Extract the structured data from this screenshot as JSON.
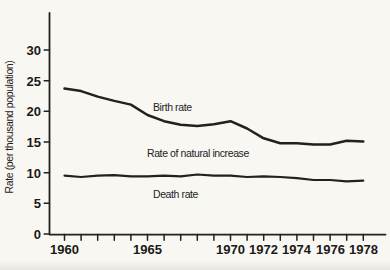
{
  "figure": {
    "background": "#f9f7f2",
    "ink": "#222120"
  },
  "chart_data": {
    "type": "line",
    "title": "",
    "xlabel": "",
    "ylabel": "Rate (per thousand population)",
    "ylim": [
      0,
      33
    ],
    "xlim": [
      1959,
      1979.3
    ],
    "grid": false,
    "legend_position": "none",
    "yticks": [
      0,
      5,
      10,
      15,
      20,
      25,
      30
    ],
    "xticks_labeled": [
      "1960",
      "1965",
      "1970",
      "1972",
      "1974",
      "1976",
      "1978"
    ],
    "xtick_minor_interval_years": 1,
    "x": [
      1960,
      1961,
      1962,
      1963,
      1964,
      1965,
      1966,
      1967,
      1968,
      1969,
      1970,
      1971,
      1972,
      1973,
      1974,
      1975,
      1976,
      1977,
      1978
    ],
    "series": [
      {
        "name": "Birth rate",
        "values": [
          23.7,
          23.3,
          22.4,
          21.7,
          21.1,
          19.4,
          18.4,
          17.8,
          17.6,
          17.9,
          18.4,
          17.2,
          15.6,
          14.8,
          14.8,
          14.6,
          14.6,
          15.2,
          15.1
        ]
      },
      {
        "name": "Death rate",
        "values": [
          9.5,
          9.3,
          9.5,
          9.6,
          9.4,
          9.4,
          9.5,
          9.4,
          9.7,
          9.5,
          9.5,
          9.3,
          9.4,
          9.3,
          9.1,
          8.8,
          8.8,
          8.6,
          8.7
        ]
      }
    ],
    "annotations": [
      {
        "text": "Birth rate",
        "year": 1965.3,
        "value": 20.1
      },
      {
        "text": "Rate of natural increase",
        "year": 1965.0,
        "value": 12.6
      },
      {
        "text": "Death rate",
        "year": 1965.3,
        "value": 5.9
      }
    ]
  }
}
